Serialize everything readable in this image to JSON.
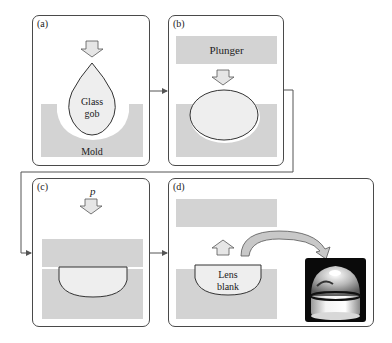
{
  "colors": {
    "panel_border": "#4a4a4a",
    "mold_gray": "#d3d3d3",
    "glass_fill": "#eeeeee",
    "arrow_fill": "#e6e6e6",
    "connector": "#555555",
    "photo_bg": "#0a0a0a"
  },
  "panels": {
    "a": {
      "label": "(a)",
      "glass_label_line1": "Glass",
      "glass_label_line2": "gob",
      "mold_label": "Mold"
    },
    "b": {
      "label": "(b)",
      "plunger_label": "Plunger"
    },
    "c": {
      "label": "(c)",
      "pressure_label": "p"
    },
    "d": {
      "label": "(d)",
      "lens_label_line1": "Lens",
      "lens_label_line2": "blank",
      "photo": "molded-glass-lens-photo"
    }
  },
  "flow": [
    "a",
    "b",
    "c",
    "d"
  ]
}
